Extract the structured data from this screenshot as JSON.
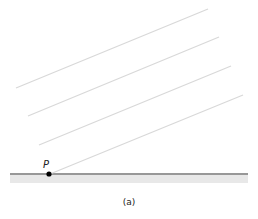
{
  "diagram": {
    "point_label": "P",
    "caption": "(a)",
    "colors": {
      "rays": "#d8d8d8",
      "ground_line": "#333333",
      "ground_shade": "#e8e8e8",
      "point": "#000000"
    },
    "rays": [
      {
        "x1": 16,
        "y1": 88,
        "x2": 208,
        "y2": 9
      },
      {
        "x1": 28,
        "y1": 116,
        "x2": 219,
        "y2": 37
      },
      {
        "x1": 39,
        "y1": 145,
        "x2": 231,
        "y2": 66
      },
      {
        "x1": 50,
        "y1": 174,
        "x2": 243,
        "y2": 95
      }
    ],
    "ground": {
      "x1": 10,
      "x2": 248,
      "y": 174
    },
    "point": {
      "x": 49,
      "y": 174
    }
  }
}
